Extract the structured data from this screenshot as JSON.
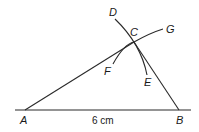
{
  "diagram": {
    "type": "geometric-construction",
    "points": {
      "A": {
        "label": "A"
      },
      "B": {
        "label": "B"
      },
      "C": {
        "label": "C"
      },
      "D": {
        "label": "D"
      },
      "E": {
        "label": "E"
      },
      "F": {
        "label": "F"
      },
      "G": {
        "label": "G"
      }
    },
    "segments": [
      {
        "from": "A",
        "to": "B",
        "length_label": "6 cm"
      },
      {
        "from": "A",
        "to": "C"
      },
      {
        "from": "C",
        "to": "B"
      }
    ],
    "arcs": [
      {
        "name": "arc-DE",
        "through": "C",
        "from": "D",
        "to": "E"
      },
      {
        "name": "arc-FG",
        "through": "C",
        "from": "F",
        "to": "G"
      }
    ],
    "colors": {
      "stroke": "#2a2a2a",
      "background": "#ffffff"
    }
  }
}
